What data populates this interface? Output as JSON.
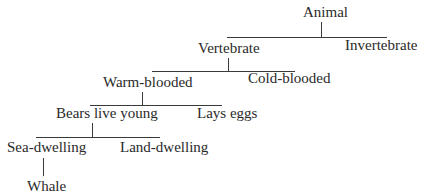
{
  "diagram": {
    "type": "taxonomy-tree",
    "nodes": {
      "animal": "Animal",
      "vertebrate": "Vertebrate",
      "invertebrate": "Invertebrate",
      "warm_blooded": "Warm-blooded",
      "cold_blooded": "Cold-blooded",
      "bears_live_young": "Bears live young",
      "lays_eggs": "Lays eggs",
      "sea_dwelling": "Sea-dwelling",
      "land_dwelling": "Land-dwelling",
      "whale": "Whale"
    },
    "edges": [
      [
        "Animal",
        "Vertebrate"
      ],
      [
        "Animal",
        "Invertebrate"
      ],
      [
        "Vertebrate",
        "Warm-blooded"
      ],
      [
        "Vertebrate",
        "Cold-blooded"
      ],
      [
        "Warm-blooded",
        "Bears live young"
      ],
      [
        "Warm-blooded",
        "Lays eggs"
      ],
      [
        "Bears live young",
        "Sea-dwelling"
      ],
      [
        "Bears live young",
        "Land-dwelling"
      ],
      [
        "Sea-dwelling",
        "Whale"
      ]
    ],
    "colors": {
      "text": "#2a2a2a",
      "line": "#3a3a3a",
      "background": "#ffffff"
    }
  }
}
